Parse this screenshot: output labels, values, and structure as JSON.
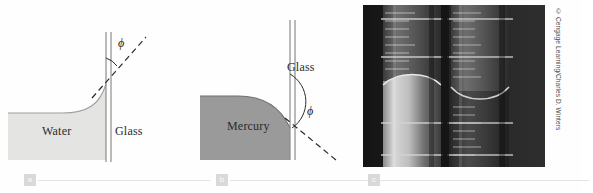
{
  "figure": {
    "panels": [
      {
        "id": "a",
        "badge": "a",
        "kind": "diagram",
        "liquid": "Water",
        "liquid_label": "Water",
        "surface_label": "Glass",
        "angle_symbol": "ϕ",
        "meniscus": "concave",
        "description": "Water curves up the glass wall; contact angle phi is small and measured between the glass wall and the dashed tangent to the liquid surface.",
        "fill_color": "#e4e4e2",
        "fill_edge_color": "#bdbdbb"
      },
      {
        "id": "b",
        "badge": "b",
        "kind": "diagram",
        "liquid": "Mercury",
        "liquid_label": "Mercury",
        "surface_label": "Glass",
        "angle_symbol": "ϕ",
        "meniscus": "convex",
        "description": "Mercury domes away from the glass wall; contact angle phi is large and measured between the glass wall and the dashed downward tangent.",
        "fill_color": "#9a9a9a",
        "fill_edge_color": "#6f6f6f"
      },
      {
        "id": "c",
        "badge": "c",
        "kind": "photograph",
        "description": "Photograph of two graduated cylinders against a dark background: the left cylinder holds mercury with a convex meniscus, the right cylinder holds water with a concave meniscus.",
        "credit": "© Cengage Learning/Charles D. Winters",
        "background_color": "#1c1c1c"
      }
    ]
  },
  "colors": {
    "page_background": "#fefefe",
    "water_fill": "#e4e4e2",
    "mercury_fill": "#9a9a9a",
    "glass_line": "#8c8c8c",
    "dash_line": "#2b2b2b",
    "badge_background": "#d9d9d9",
    "badge_text": "#f3f3f3",
    "rule": "#e3e3e3",
    "photo_background": "#1c1c1c",
    "credit_text": "#4a4a4a"
  }
}
